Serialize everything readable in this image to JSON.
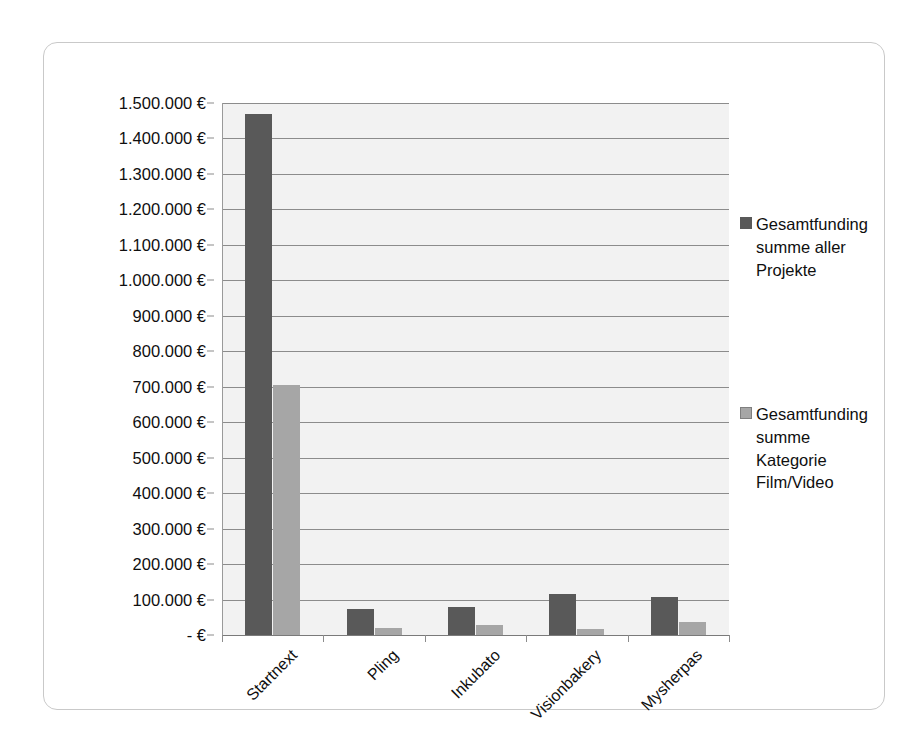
{
  "chart_data": {
    "type": "bar",
    "title": "",
    "subtitle": "",
    "xlabel": "",
    "ylabel": "",
    "categories": [
      "Startnext",
      "Pling",
      "Inkubato",
      "Visionbakery",
      "Mysherpas"
    ],
    "series": [
      {
        "name": "Gesamtfunding summe aller Projekte",
        "name_lines": [
          "Gesamtfunding",
          "summe aller",
          "Projekte"
        ],
        "color": "#595959",
        "values": [
          1470000,
          72000,
          78000,
          115000,
          107000
        ]
      },
      {
        "name": "Gesamtfunding summe Kategorie Film/Video",
        "name_lines": [
          "Gesamtfunding",
          "summe",
          "Kategorie",
          "Film/Video"
        ],
        "color": "#a6a6a6",
        "values": [
          705000,
          20000,
          28000,
          18000,
          36000
        ]
      }
    ],
    "ylim": [
      0,
      1500000
    ],
    "y_tick_values": [
      0,
      100000,
      200000,
      300000,
      400000,
      500000,
      600000,
      700000,
      800000,
      900000,
      1000000,
      1100000,
      1200000,
      1300000,
      1400000,
      1500000
    ],
    "y_tick_labels": [
      "- €",
      "100.000 €",
      "200.000 €",
      "300.000 €",
      "400.000 €",
      "500.000 €",
      "600.000 €",
      "700.000 €",
      "800.000 €",
      "900.000 €",
      "1.000.000 €",
      "1.100.000 €",
      "1.200.000 €",
      "1.300.000 €",
      "1.400.000 €",
      "1.500.000 €"
    ],
    "grid": true,
    "grid_axis": "y",
    "legend_position": "right",
    "plot_background": "#f2f2f2",
    "x_label_rotation": -45
  }
}
